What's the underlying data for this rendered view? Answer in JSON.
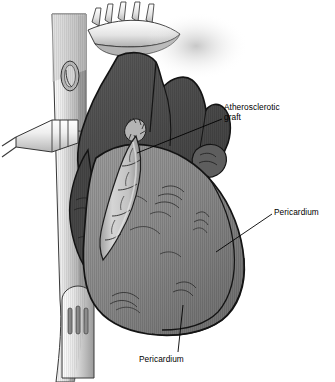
{
  "figure": {
    "domain": "medical-illustration",
    "background_color": "#ffffff",
    "width": 335,
    "height": 382
  },
  "palette": {
    "background": "#ffffff",
    "outline": "#1a1a1a",
    "heart_dark": "#4d4d4d",
    "heart_mid_dark": "#5c5c5c",
    "heart_mid": "#8a8a8a",
    "heart_light": "#9a9a9a",
    "graft_light": "#c8c8c8",
    "graft_shadow": "#9c9c9c",
    "sternum_light": "#e6e6e6",
    "sternum_mid": "#bdbdbd",
    "sternum_dark": "#8f8f8f",
    "cannula_light": "#ededed",
    "cannula_mid": "#c4c4c4",
    "rib_light": "#f2f2f2",
    "text": "#000000"
  },
  "annotations": [
    {
      "id": "atherosclerotic-graft",
      "text": "Atherosclerotic\ngraft",
      "lines": [
        "Atherosclerotic",
        "graft"
      ],
      "label_x": 224,
      "label_y": 103,
      "leader": {
        "x1": 222,
        "y1": 119,
        "x2": 137,
        "y2": 153
      }
    },
    {
      "id": "pericardium-right",
      "text": "Pericardium",
      "lines": [
        "Pericardium"
      ],
      "label_x": 274,
      "label_y": 208,
      "leader": {
        "x1": 272,
        "y1": 214,
        "x2": 216,
        "y2": 252
      }
    },
    {
      "id": "pericardium-bottom",
      "text": "Pericardium",
      "lines": [
        "Pericardium"
      ],
      "label_x": 139,
      "label_y": 355,
      "leader": {
        "x1": 178,
        "y1": 352,
        "x2": 183,
        "y2": 305
      }
    }
  ],
  "structures": [
    {
      "id": "rib-ends",
      "name": "rib-ends",
      "tone": "#f2f2f2"
    },
    {
      "id": "sternum-column",
      "name": "sternum-retractor-column",
      "tone": "#cccccc"
    },
    {
      "id": "retractor-oval",
      "name": "retractor-oval-opening",
      "tone": "#b5b5b5"
    },
    {
      "id": "retractor-blade",
      "name": "retractor-blade-slots",
      "tone": "#c9c9c9"
    },
    {
      "id": "cannula",
      "name": "cannula-tube",
      "tone": "#e0e0e0"
    },
    {
      "id": "atrium-mass",
      "name": "heart-dark-atrium",
      "tone": "#4d4d4d"
    },
    {
      "id": "appendage",
      "name": "atrial-appendage",
      "tone": "#5c5c5c"
    },
    {
      "id": "ventricle",
      "name": "heart-ventricle",
      "tone": "#8a8a8a"
    },
    {
      "id": "graft-vessel",
      "name": "atherosclerotic-graft-vessel",
      "tone": "#c8c8c8"
    },
    {
      "id": "pericardium-edge",
      "name": "pericardium-reflection-edge",
      "tone": "#1a1a1a"
    }
  ]
}
